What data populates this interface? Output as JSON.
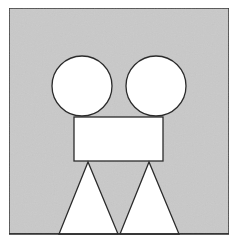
{
  "canvas": {
    "width": 233,
    "height": 247,
    "background": "#ffffff"
  },
  "colors": {
    "panel_fill": "#c9c9c9",
    "shape_fill": "#ffffff",
    "stroke": "#2b2b2b"
  },
  "shapes": {
    "panel": {
      "x": 9,
      "y": 8,
      "width": 220,
      "height": 226
    },
    "left_circle": {
      "cx": 82,
      "cy": 86,
      "r": 30
    },
    "right_circle": {
      "cx": 156,
      "cy": 86,
      "r": 30
    },
    "rectangle": {
      "x": 74,
      "y": 117,
      "width": 89,
      "height": 44
    },
    "left_triangle": {
      "points": "88,162 59,234 118,234"
    },
    "right_triangle": {
      "points": "149,162 120,234 179,234"
    }
  }
}
